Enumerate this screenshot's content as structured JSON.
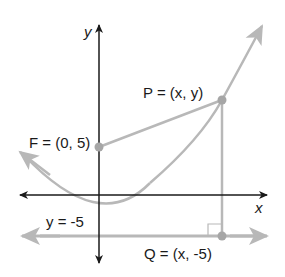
{
  "diagram": {
    "axes": {
      "x_label": "x",
      "y_label": "y"
    },
    "labels": {
      "focus": "F = (0, 5)",
      "point_p": "P = (x, y)",
      "point_q": "Q = (x, -5)",
      "directrix": "y = -5"
    },
    "colors": {
      "axis": "#1a1a1a",
      "curve": "#b3b3b3",
      "point": "#a6a6a6",
      "text": "#1a1a1a"
    }
  }
}
